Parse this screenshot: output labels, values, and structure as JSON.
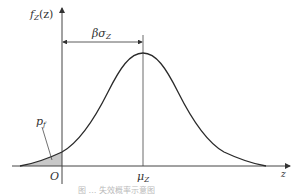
{
  "diagram": {
    "type": "normal-distribution-pdf",
    "y_axis_label": "f",
    "y_axis_label_sub": "Z",
    "y_axis_label_arg": "(z)",
    "x_axis_label": "z",
    "origin_label": "O",
    "mean_label": "μ",
    "mean_label_sub": "Z",
    "distance_label": "βσ",
    "distance_label_sub": "Z",
    "tail_prob_label": "p",
    "tail_prob_label_sub": "f",
    "caption": "图 … 失效概率示意图",
    "colors": {
      "curve": "#2a2a2a",
      "axes": "#444444",
      "shaded_tail": "#c8c8c8",
      "text": "#333333"
    }
  }
}
